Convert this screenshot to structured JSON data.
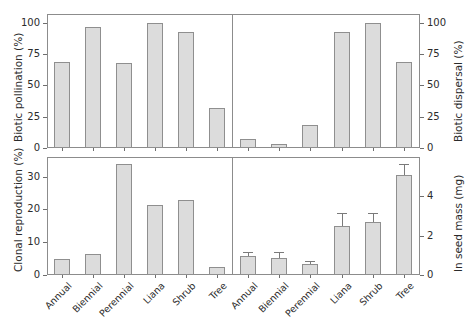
{
  "figure": {
    "categories": [
      "Annual",
      "Biennial",
      "Perennial",
      "Liana",
      "Shrub",
      "Tree"
    ]
  },
  "chart_data": [
    {
      "id": "biotic-pollination",
      "type": "bar",
      "title": "",
      "panel_position": "top-left",
      "xlabel": "",
      "ylabel": "Biotic pollination (%)",
      "ylabel_side": "left",
      "categories": [
        "Annual",
        "Biennial",
        "Perennial",
        "Liana",
        "Shrub",
        "Tree"
      ],
      "values": [
        69,
        97,
        68,
        100,
        93,
        32
      ],
      "errors": [
        0,
        0,
        0,
        0,
        0,
        0
      ],
      "ylim": [
        0,
        107
      ],
      "yticks": [
        0,
        25,
        50,
        75,
        100
      ],
      "ytick_labels": [
        "0",
        "25",
        "50",
        "75",
        "100"
      ],
      "grid": false,
      "legend": "none"
    },
    {
      "id": "biotic-dispersal",
      "type": "bar",
      "title": "",
      "panel_position": "top-right",
      "xlabel": "",
      "ylabel": "Biotic dispersal (%)",
      "ylabel_side": "right",
      "categories": [
        "Annual",
        "Biennial",
        "Perennial",
        "Liana",
        "Shrub",
        "Tree"
      ],
      "values": [
        7,
        3,
        18,
        93,
        100,
        69
      ],
      "errors": [
        0,
        0,
        0,
        0,
        0,
        0
      ],
      "ylim": [
        0,
        107
      ],
      "yticks": [
        0,
        25,
        50,
        75,
        100
      ],
      "ytick_labels": [
        "0",
        "25",
        "50",
        "75",
        "100"
      ],
      "grid": false,
      "legend": "none"
    },
    {
      "id": "clonal-reproduction",
      "type": "bar",
      "title": "",
      "panel_position": "bottom-left",
      "xlabel": "",
      "ylabel": "Clonal reproduction (%)",
      "ylabel_side": "left",
      "categories": [
        "Annual",
        "Biennial",
        "Perennial",
        "Liana",
        "Shrub",
        "Tree"
      ],
      "values": [
        4.9,
        6.3,
        34.0,
        21.4,
        23.0,
        2.3
      ],
      "errors": [
        0,
        0,
        0,
        0,
        0,
        0
      ],
      "ylim": [
        0,
        36
      ],
      "yticks": [
        0,
        10,
        20,
        30
      ],
      "ytick_labels": [
        "0",
        "10",
        "20",
        "30"
      ],
      "grid": false,
      "legend": "none"
    },
    {
      "id": "ln-seed-mass",
      "type": "bar",
      "title": "",
      "panel_position": "bottom-right",
      "xlabel": "",
      "ylabel": "ln seed mass (mg)",
      "ylabel_side": "right",
      "categories": [
        "Annual",
        "Biennial",
        "Perennial",
        "Liana",
        "Shrub",
        "Tree"
      ],
      "values": [
        0.95,
        0.85,
        0.55,
        2.5,
        2.7,
        5.1
      ],
      "errors": [
        0.18,
        0.25,
        0.12,
        0.6,
        0.42,
        0.5
      ],
      "ylim": [
        0,
        6.0
      ],
      "yticks": [
        0,
        2,
        4
      ],
      "ytick_labels": [
        "0",
        "2",
        "4"
      ],
      "grid": false,
      "legend": "none"
    }
  ]
}
